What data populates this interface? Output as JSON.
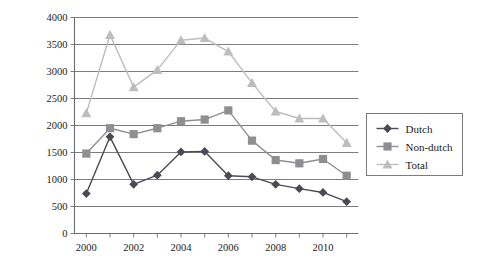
{
  "chart_data": {
    "type": "line",
    "title": "",
    "xlabel": "",
    "ylabel": "",
    "grid": "horizontal",
    "legend_position": "right-middle",
    "x": [
      2000,
      2001,
      2002,
      2003,
      2004,
      2005,
      2006,
      2007,
      2008,
      2009,
      2010,
      2011
    ],
    "xlim": [
      1999.5,
      2011.5
    ],
    "ylim": [
      0,
      4000
    ],
    "ytick_labels": [
      "0",
      "500",
      "1000",
      "1500",
      "2000",
      "2500",
      "3000",
      "3500",
      "4000"
    ],
    "ytick_values": [
      0,
      500,
      1000,
      1500,
      2000,
      2500,
      3000,
      3500,
      4000
    ],
    "xtick_labels": [
      "2000",
      "2002",
      "2004",
      "2006",
      "2008",
      "2010"
    ],
    "xtick_values": [
      2000,
      2002,
      2004,
      2006,
      2008,
      2010
    ],
    "series": [
      {
        "name": "Dutch",
        "marker": "diamond",
        "color": "#4a4a55",
        "values": [
          740,
          1790,
          910,
          1080,
          1510,
          1520,
          1070,
          1050,
          910,
          830,
          760,
          590
        ]
      },
      {
        "name": "Non-dutch",
        "marker": "square",
        "color": "#8f8f93",
        "values": [
          1480,
          1950,
          1840,
          1950,
          2080,
          2110,
          2280,
          1720,
          1360,
          1300,
          1380,
          1070
        ]
      },
      {
        "name": "Total",
        "marker": "triangle",
        "color": "#bdbdc0",
        "values": [
          2230,
          3680,
          2710,
          3030,
          3580,
          3620,
          3370,
          2790,
          2260,
          2130,
          2130,
          1680
        ]
      }
    ]
  },
  "legend": {
    "entries": [
      {
        "label": "Dutch"
      },
      {
        "label": "Non-dutch"
      },
      {
        "label": "Total"
      }
    ]
  },
  "axes": {
    "y_axis_name": "value-axis",
    "x_axis_name": "year-axis"
  }
}
